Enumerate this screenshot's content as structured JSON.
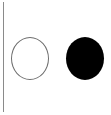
{
  "canvas": {
    "width": 111,
    "height": 115,
    "background_color": "#ffffff"
  },
  "divider": {
    "orientation": "vertical",
    "color": "#8a8a8a",
    "thickness_px": 1,
    "x_px": 3,
    "y_start_px": 2,
    "y_end_px": 112
  },
  "shapes": [
    {
      "id": "circle-outline",
      "icon_name": "circle-outline-icon",
      "state": "unfilled",
      "fill_color": "#ffffff",
      "stroke_color": "#6e6e6e",
      "stroke_width_px": 1,
      "center_x_px": 30,
      "center_y_px": 58,
      "width_px": 38,
      "height_px": 43
    },
    {
      "id": "circle-filled",
      "icon_name": "circle-filled-icon",
      "state": "filled",
      "fill_color": "#000000",
      "stroke_color": "none",
      "stroke_width_px": 0,
      "center_x_px": 85,
      "center_y_px": 58,
      "width_px": 38,
      "height_px": 43
    }
  ],
  "labels": {
    "figure_caption": "",
    "circle_outline_label": "",
    "circle_filled_label": ""
  }
}
